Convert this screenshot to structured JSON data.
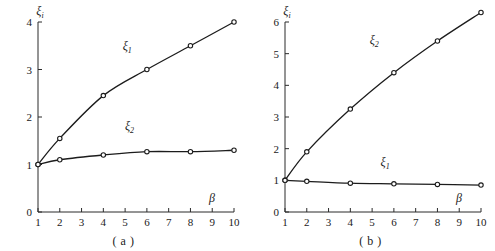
{
  "figure": {
    "background_color": "#ffffff",
    "line_color": "#1c1c1c",
    "axis_color": "#2b2b2b",
    "marker_fill": "#ffffff"
  },
  "panels": [
    {
      "caption": "( a )",
      "chart_data": {
        "type": "line",
        "title": "",
        "xlabel": "β",
        "ylabel": "ξ",
        "ylabel_sub": "i",
        "x": [
          1,
          2,
          4,
          6,
          8,
          10
        ],
        "xlim": [
          1,
          10
        ],
        "ylim": [
          0,
          4
        ],
        "xticks": [
          "1",
          "2",
          "3",
          "4",
          "5",
          "6",
          "7",
          "8",
          "9",
          "10"
        ],
        "xtick_values": [
          1,
          2,
          3,
          4,
          5,
          6,
          7,
          8,
          9,
          10
        ],
        "yticks": [
          "0",
          "1",
          "2",
          "3",
          "4"
        ],
        "ytick_values": [
          0,
          1,
          2,
          3,
          4
        ],
        "grid": false,
        "legend": "inline-annotations",
        "marker": "open-circle",
        "series": [
          {
            "name": "ξ",
            "name_sub": "1",
            "label_x": 5.1,
            "label_y": 3.42,
            "values": [
              1.0,
              1.55,
              2.45,
              3.0,
              3.5,
              4.0
            ]
          },
          {
            "name": "ξ",
            "name_sub": "2",
            "label_x": 5.2,
            "label_y": 1.73,
            "values": [
              1.0,
              1.1,
              1.2,
              1.27,
              1.27,
              1.3
            ]
          }
        ]
      }
    },
    {
      "caption": "( b )",
      "chart_data": {
        "type": "line",
        "title": "",
        "xlabel": "β",
        "ylabel": "ξ",
        "ylabel_sub": "i",
        "x": [
          1,
          2,
          4,
          6,
          8,
          10
        ],
        "xlim": [
          1,
          10
        ],
        "ylim": [
          0,
          6
        ],
        "xticks": [
          "1",
          "2",
          "3",
          "4",
          "5",
          "6",
          "7",
          "8",
          "9",
          "10"
        ],
        "xtick_values": [
          1,
          2,
          3,
          4,
          5,
          6,
          7,
          8,
          9,
          10
        ],
        "yticks": [
          "0",
          "1",
          "2",
          "3",
          "4",
          "5",
          "6"
        ],
        "ytick_values": [
          0,
          1,
          2,
          3,
          4,
          5,
          6
        ],
        "grid": false,
        "legend": "inline-annotations",
        "marker": "open-circle",
        "series": [
          {
            "name": "ξ",
            "name_sub": "2",
            "label_x": 5.1,
            "label_y": 5.3,
            "values": [
              1.0,
              1.9,
              3.25,
              4.4,
              5.4,
              6.3
            ]
          },
          {
            "name": "ξ",
            "name_sub": "1",
            "label_x": 5.6,
            "label_y": 1.45,
            "values": [
              1.0,
              0.97,
              0.91,
              0.89,
              0.87,
              0.85
            ]
          }
        ]
      }
    }
  ]
}
